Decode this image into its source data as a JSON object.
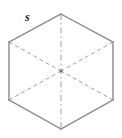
{
  "figure": {
    "shape_name": "hexagon",
    "background_color": "#ffffff",
    "edge_color": "#8a8a8a",
    "hidden_line_color": "#9e9e9e",
    "label_color": "#1d1d1d",
    "canvas": {
      "width": 122,
      "height": 138
    }
  },
  "labels": {
    "side_label": "s"
  },
  "geometry": {
    "center": {
      "x": 61,
      "y": 71
    },
    "vertices": [
      {
        "name": "top",
        "x": 61,
        "y": 14
      },
      {
        "name": "upper-right",
        "x": 113,
        "y": 42
      },
      {
        "name": "lower-right",
        "x": 113,
        "y": 100
      },
      {
        "name": "bottom",
        "x": 61,
        "y": 129
      },
      {
        "name": "lower-left",
        "x": 9,
        "y": 100
      },
      {
        "name": "upper-left",
        "x": 9,
        "y": 42
      }
    ],
    "outline_path": "M 61 14 L 113 42 L 113 100 L 61 129 L 9 100 L 9 42 Z",
    "internal_lines": [
      {
        "name": "vertical-axis",
        "style": "dash-dot",
        "from": "top",
        "to": "bottom"
      },
      {
        "name": "diagonal-upper-left-to-center",
        "style": "dashed",
        "from": "upper-left",
        "to": "center"
      },
      {
        "name": "diagonal-lower-left-to-center",
        "style": "dashed",
        "from": "lower-left",
        "to": "center"
      },
      {
        "name": "diagonal-upper-right-to-center",
        "style": "dashed",
        "from": "upper-right",
        "to": "center"
      },
      {
        "name": "diagonal-lower-right-to-center",
        "style": "dashed",
        "from": "lower-right",
        "to": "center"
      }
    ],
    "label_position": {
      "x": 25,
      "y": 11
    }
  }
}
